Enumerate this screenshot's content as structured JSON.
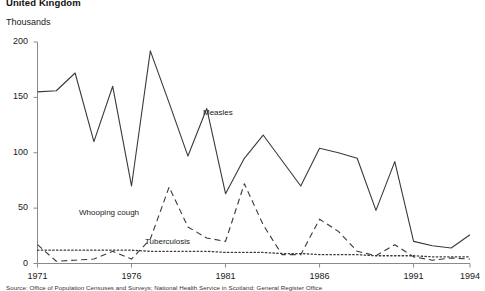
{
  "chart": {
    "title": "United Kingdom",
    "unit_label": "Thousands",
    "footer": "Source: Office of Population Censuses and Surveys; National Health Service in Scotland; General Register Office"
  },
  "chart_data": {
    "type": "line",
    "title": "United Kingdom",
    "xlabel": "",
    "ylabel": "Thousands",
    "ylim": [
      0,
      200
    ],
    "xlim": [
      1971,
      1994
    ],
    "grid": false,
    "legend": "inline-annotations",
    "yticks": [
      0,
      50,
      100,
      150,
      200
    ],
    "xticks": [
      1971,
      1976,
      1981,
      1986,
      1991,
      1994
    ],
    "x": [
      1971,
      1972,
      1973,
      1974,
      1975,
      1976,
      1977,
      1978,
      1979,
      1980,
      1981,
      1982,
      1983,
      1984,
      1985,
      1986,
      1987,
      1988,
      1989,
      1990,
      1991,
      1992,
      1993,
      1994
    ],
    "series": [
      {
        "name": "Measles",
        "style": "solid",
        "color": "#3a3a3a",
        "values": [
          155,
          156,
          172,
          110,
          160,
          70,
          192,
          145,
          97,
          140,
          63,
          95,
          116,
          93,
          70,
          104,
          100,
          95,
          48,
          92,
          20,
          16,
          14,
          26
        ]
      },
      {
        "name": "Whooping cough",
        "style": "dashed",
        "color": "#3a3a3a",
        "values": [
          17,
          2,
          3,
          4,
          11,
          4,
          22,
          69,
          33,
          23,
          20,
          72,
          35,
          8,
          8,
          40,
          29,
          11,
          7,
          17,
          6,
          3,
          5,
          4
        ]
      },
      {
        "name": "Tuberculosis",
        "style": "dotted",
        "color": "#3a3a3a",
        "values": [
          12,
          12,
          12,
          12,
          12,
          12,
          11,
          11,
          11,
          11,
          10,
          10,
          10,
          9,
          9,
          8,
          8,
          8,
          7,
          7,
          7,
          6,
          6,
          6
        ]
      }
    ],
    "annotations": [
      {
        "text": "Measles",
        "x": 1981,
        "y": 120
      },
      {
        "text": "Whooping cough",
        "x": 1974,
        "y": 36
      },
      {
        "text": "Tuberculosis",
        "x": 1979,
        "y": 19
      }
    ]
  },
  "ytick_labels": [
    "0",
    "50",
    "100",
    "150",
    "200"
  ],
  "xtick_labels": [
    "1971",
    "1976",
    "1981",
    "1986",
    "1991",
    "1994"
  ],
  "series_labels": {
    "measles": "Measles",
    "whooping_cough": "Whooping cough",
    "tuberculosis": "Tuberculosis"
  }
}
